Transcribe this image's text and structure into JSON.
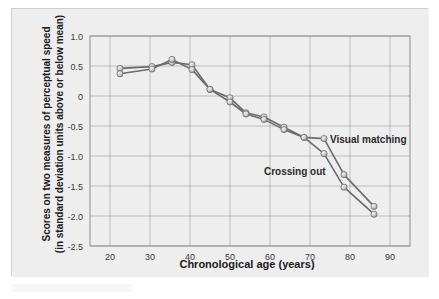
{
  "figure": {
    "background_color": "#eeeeee",
    "plot_background_color": "#ededed",
    "border_color": "#cfcfcf",
    "grid_color": "#a8a8a8",
    "axis_color": "#8d8d8d"
  },
  "chart_data": {
    "type": "line",
    "title": "",
    "xlabel": "Chronological age (years)",
    "ylabel_line1": "Scores on two measures of perceptual speed",
    "ylabel_line2": "(in standard deviation units above or below mean)",
    "xlim": [
      15,
      95
    ],
    "ylim": [
      -2.5,
      1.0
    ],
    "grid": true,
    "legend_position": "inline-annotations",
    "xticks": [
      20,
      30,
      40,
      50,
      60,
      70,
      80,
      90
    ],
    "xtick_labels": [
      "20",
      "30",
      "40",
      "50",
      "60",
      "70",
      "80",
      "90"
    ],
    "yticks": [
      1.0,
      0.5,
      0,
      -0.5,
      -1.0,
      -1.5,
      -2.0,
      -2.5
    ],
    "ytick_labels": [
      "1.0",
      "0.5",
      "0",
      "-0.5",
      "-1.0",
      "-1.5",
      "-2.0",
      "-2.5"
    ],
    "marker_color": "#c9c9c9",
    "marker_edge_color": "#6e6e6e",
    "line_color": "#6b6b6b",
    "series": [
      {
        "name": "Visual matching",
        "label_x": 75,
        "label_y": -0.78,
        "x": [
          22.5,
          30.5,
          35.5,
          40.5,
          45,
          50,
          54,
          58.5,
          63.5,
          68.5,
          73.5,
          78.5,
          86
        ],
        "values": [
          0.46,
          0.49,
          0.56,
          0.52,
          0.11,
          -0.03,
          -0.28,
          -0.35,
          -0.52,
          -0.69,
          -0.71,
          -1.31,
          -1.84
        ]
      },
      {
        "name": "Crossing out",
        "label_x": 58.5,
        "label_y": -1.32,
        "x": [
          22.5,
          30.5,
          35.5,
          40.5,
          45,
          50,
          54,
          58.5,
          63.5,
          68.5,
          73.5,
          78.5,
          86
        ],
        "values": [
          0.37,
          0.45,
          0.61,
          0.44,
          0.11,
          -0.1,
          -0.3,
          -0.39,
          -0.56,
          -0.69,
          -0.96,
          -1.52,
          -1.97
        ]
      }
    ]
  }
}
